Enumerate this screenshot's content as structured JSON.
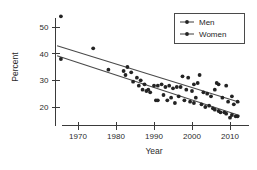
{
  "chart_data": {
    "type": "scatter",
    "title": "",
    "xlabel": "Year",
    "ylabel": "Percent",
    "xlim": [
      1964,
      2013
    ],
    "ylim": [
      15,
      55
    ],
    "grid": false,
    "legend_position": "top-right",
    "xticks": [
      "1970",
      "1980",
      "1990",
      "2000",
      "2010"
    ],
    "xtick_values": [
      1970,
      1980,
      1990,
      2000,
      2010
    ],
    "yticks": [
      "20",
      "30",
      "40",
      "50"
    ],
    "ytick_values": [
      20,
      30,
      40,
      50
    ],
    "series": [
      {
        "name": "Men",
        "marker": "filled-circle",
        "color": "#232323",
        "trend_line": {
          "x_start": 1964.5,
          "y_start": 43.0,
          "x_end": 2012.5,
          "y_end": 21.8
        },
        "points": [
          {
            "x": 1965.5,
            "y": 54.0
          },
          {
            "x": 1974.0,
            "y": 42.0
          },
          {
            "x": 1983.0,
            "y": 35.0
          },
          {
            "x": 1984.0,
            "y": 33.0
          },
          {
            "x": 1985.5,
            "y": 31.0
          },
          {
            "x": 1986.5,
            "y": 30.0
          },
          {
            "x": 1987.5,
            "y": 28.5
          },
          {
            "x": 1988.5,
            "y": 26.5
          },
          {
            "x": 1990.0,
            "y": 28.0
          },
          {
            "x": 1991.0,
            "y": 28.0
          },
          {
            "x": 1992.0,
            "y": 28.5
          },
          {
            "x": 1993.0,
            "y": 27.5
          },
          {
            "x": 1994.0,
            "y": 28.0
          },
          {
            "x": 1995.0,
            "y": 27.0
          },
          {
            "x": 1996.0,
            "y": 27.5
          },
          {
            "x": 1997.0,
            "y": 27.5
          },
          {
            "x": 1997.5,
            "y": 31.5
          },
          {
            "x": 1998.5,
            "y": 26.5
          },
          {
            "x": 1999.0,
            "y": 31.0
          },
          {
            "x": 2000.0,
            "y": 26.0
          },
          {
            "x": 2000.5,
            "y": 28.5
          },
          {
            "x": 2001.5,
            "y": 29.0
          },
          {
            "x": 2002.0,
            "y": 32.0
          },
          {
            "x": 2003.0,
            "y": 25.5
          },
          {
            "x": 2004.0,
            "y": 25.0
          },
          {
            "x": 2005.0,
            "y": 24.0
          },
          {
            "x": 2006.0,
            "y": 26.5
          },
          {
            "x": 2006.5,
            "y": 29.0
          },
          {
            "x": 2007.0,
            "y": 28.5
          },
          {
            "x": 2008.0,
            "y": 23.5
          },
          {
            "x": 2009.0,
            "y": 28.0
          },
          {
            "x": 2009.5,
            "y": 22.0
          },
          {
            "x": 2010.5,
            "y": 24.0
          },
          {
            "x": 2011.0,
            "y": 21.0
          },
          {
            "x": 2012.0,
            "y": 22.0
          }
        ]
      },
      {
        "name": "Women",
        "marker": "filled-circle",
        "color": "#232323",
        "trend_line": {
          "x_start": 1964.5,
          "y_start": 39.2,
          "x_end": 2012.5,
          "y_end": 16.8
        },
        "points": [
          {
            "x": 1965.5,
            "y": 38.0
          },
          {
            "x": 1978.0,
            "y": 34.0
          },
          {
            "x": 1982.0,
            "y": 33.5
          },
          {
            "x": 1982.5,
            "y": 32.0
          },
          {
            "x": 1984.5,
            "y": 29.5
          },
          {
            "x": 1986.0,
            "y": 28.0
          },
          {
            "x": 1987.0,
            "y": 26.5
          },
          {
            "x": 1988.0,
            "y": 26.0
          },
          {
            "x": 1989.0,
            "y": 25.5
          },
          {
            "x": 1990.5,
            "y": 22.5
          },
          {
            "x": 1991.0,
            "y": 22.5
          },
          {
            "x": 1992.5,
            "y": 24.5
          },
          {
            "x": 1993.5,
            "y": 22.5
          },
          {
            "x": 1994.5,
            "y": 23.5
          },
          {
            "x": 1995.5,
            "y": 21.5
          },
          {
            "x": 1996.5,
            "y": 24.0
          },
          {
            "x": 1998.0,
            "y": 22.5
          },
          {
            "x": 1999.5,
            "y": 22.0
          },
          {
            "x": 2000.5,
            "y": 21.5
          },
          {
            "x": 2001.0,
            "y": 23.5
          },
          {
            "x": 2002.5,
            "y": 21.0
          },
          {
            "x": 2003.5,
            "y": 20.0
          },
          {
            "x": 2004.5,
            "y": 20.5
          },
          {
            "x": 2005.5,
            "y": 19.5
          },
          {
            "x": 2006.0,
            "y": 19.0
          },
          {
            "x": 2007.0,
            "y": 18.5
          },
          {
            "x": 2007.5,
            "y": 18.0
          },
          {
            "x": 2008.5,
            "y": 18.0
          },
          {
            "x": 2009.0,
            "y": 17.5
          },
          {
            "x": 2010.0,
            "y": 16.0
          },
          {
            "x": 2010.5,
            "y": 17.0
          },
          {
            "x": 2011.5,
            "y": 16.5
          },
          {
            "x": 2012.0,
            "y": 16.5
          }
        ]
      }
    ]
  },
  "legend": {
    "entries": [
      {
        "label": "Men"
      },
      {
        "label": "Women"
      }
    ]
  }
}
